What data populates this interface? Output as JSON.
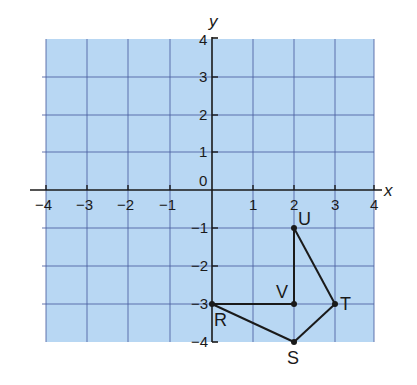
{
  "diagram": {
    "type": "coordinate-grid",
    "background_color": "#b8d7f3",
    "grid_line_color": "#4a5fa0",
    "axis_color": "#1a1a1a",
    "x_axis": {
      "label": "x",
      "min": -4,
      "max": 4,
      "ticks": [
        "-4",
        "-3",
        "-2",
        "-1",
        "1",
        "2",
        "3",
        "4"
      ]
    },
    "y_axis": {
      "label": "y",
      "min": -4,
      "max": 4,
      "ticks": [
        "4",
        "3",
        "2",
        "1",
        "0",
        "-1",
        "-2",
        "-3",
        "-4"
      ]
    },
    "points": [
      {
        "name": "R",
        "x": 0,
        "y": -3
      },
      {
        "name": "S",
        "x": 2,
        "y": -4
      },
      {
        "name": "T",
        "x": 3,
        "y": -3
      },
      {
        "name": "U",
        "x": 2,
        "y": -1
      },
      {
        "name": "V",
        "x": 2,
        "y": -3
      }
    ],
    "segments": [
      [
        "R",
        "S"
      ],
      [
        "S",
        "T"
      ],
      [
        "T",
        "U"
      ],
      [
        "U",
        "V"
      ],
      [
        "V",
        "R"
      ]
    ]
  },
  "labels": {
    "x_axis_name": "x",
    "y_axis_name": "y",
    "origin": "0",
    "R": "R",
    "S": "S",
    "T": "T",
    "U": "U",
    "V": "V",
    "xt_m4": "−4",
    "xt_m3": "−3",
    "xt_m2": "−2",
    "xt_m1": "−1",
    "xt_1": "1",
    "xt_2": "2",
    "xt_3": "3",
    "xt_4": "4",
    "yt_4": "4",
    "yt_3": "3",
    "yt_2": "2",
    "yt_1": "1",
    "yt_m1": "−1",
    "yt_m2": "−2",
    "yt_m3": "−3",
    "yt_m4": "−4"
  }
}
